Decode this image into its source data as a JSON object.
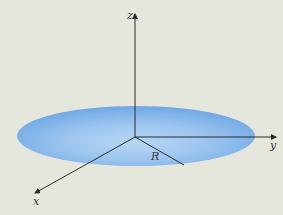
{
  "diagram": {
    "axes": {
      "x_label": "x",
      "y_label": "y",
      "z_label": "z"
    },
    "radius_label": "R",
    "colors": {
      "background": "#e6e7dc",
      "disk": "#7fb2e8",
      "disk_light": "#b3d3f3",
      "axis": "#2b2b2b"
    }
  }
}
